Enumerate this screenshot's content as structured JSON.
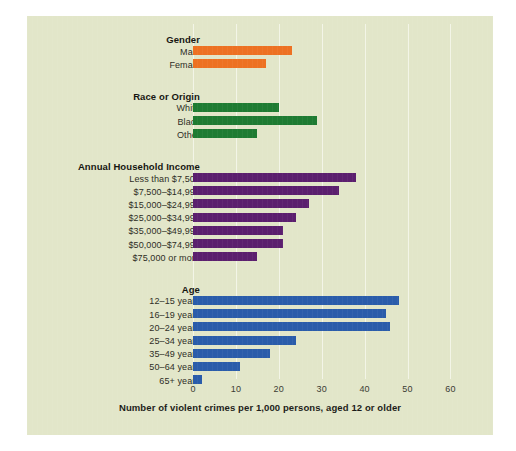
{
  "chart_data": {
    "type": "bar",
    "orientation": "horizontal",
    "title": "",
    "xlabel": "Number of violent crimes per 1,000 persons, aged 12 or older",
    "ylabel": "",
    "xlim": [
      0,
      60
    ],
    "xticks": [
      0,
      10,
      20,
      30,
      40,
      50,
      60
    ],
    "xtick_labels": [
      "0",
      "10",
      "20",
      "30",
      "40",
      "50",
      "60"
    ],
    "grid": true,
    "legend": "none",
    "background_color": "#e2e6c9",
    "groups": [
      {
        "name": "Gender",
        "color": "#ed7122",
        "categories": [
          "Male",
          "Female"
        ],
        "values": [
          23,
          17
        ]
      },
      {
        "name": "Race or Origin",
        "color": "#1e7b32",
        "categories": [
          "White",
          "Black",
          "Other"
        ],
        "values": [
          20,
          29,
          15
        ]
      },
      {
        "name": "Annual Household Income",
        "color": "#5b1f6e",
        "categories": [
          "Less than $7,500",
          "$7,500–$14,999",
          "$15,000–$24,999",
          "$25,000–$34,999",
          "$35,000–$49,999",
          "$50,000–$74,999",
          "$75,000 or more"
        ],
        "values": [
          38,
          34,
          27,
          24,
          21,
          21,
          15
        ]
      },
      {
        "name": "Age",
        "color": "#2a5caa",
        "categories": [
          "12–15 years",
          "16–19 years",
          "20–24 years",
          "25–34 years",
          "35–49 years",
          "50–64 years",
          "65+ years"
        ],
        "values": [
          48,
          45,
          46,
          24,
          18,
          11,
          2
        ]
      }
    ]
  }
}
